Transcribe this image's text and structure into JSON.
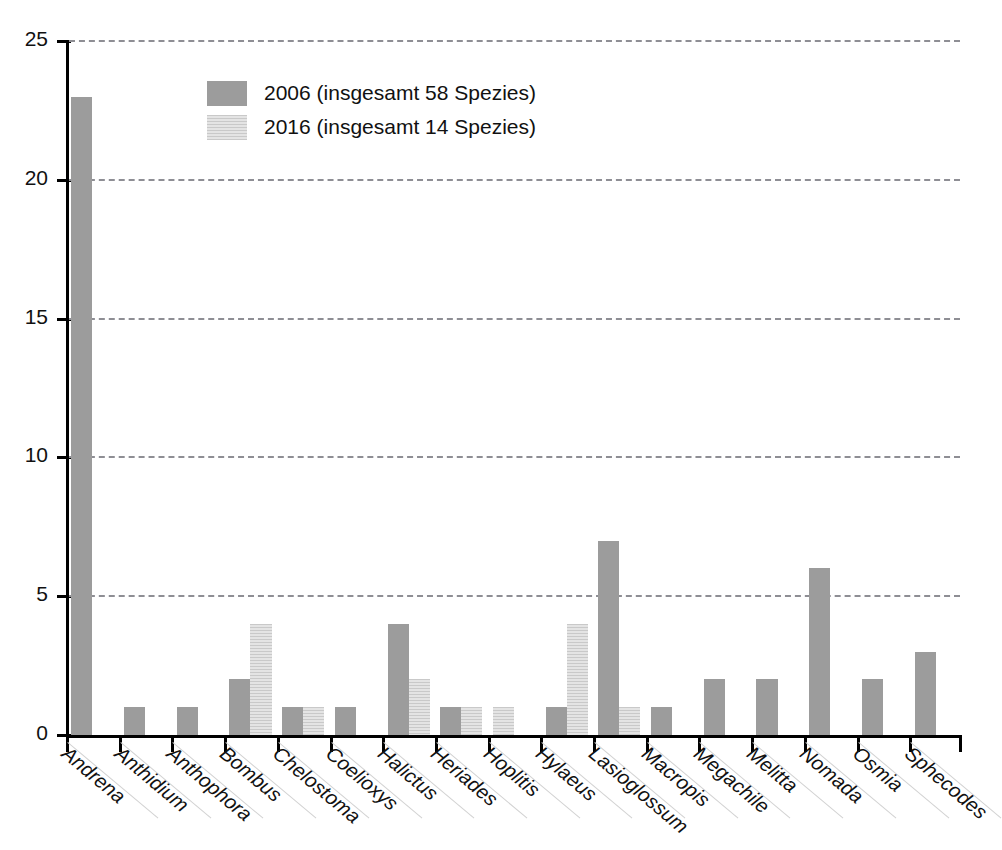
{
  "crop_fragment": "..",
  "legend": {
    "position": "inside-top-left",
    "entries": [
      {
        "label": "2006 (insgesamt 58 Spezies)",
        "color": "#9c9c9c",
        "pattern": "solid"
      },
      {
        "label": "2016 (insgesamt 14 Spezies)",
        "color": "#dcdcdc",
        "pattern": "horizontal-lines"
      }
    ]
  },
  "chart_data": {
    "type": "bar",
    "title": "",
    "subtitle": "",
    "xlabel": "",
    "ylabel": "",
    "ylim": [
      0,
      25
    ],
    "yticks": [
      0,
      5,
      10,
      15,
      20,
      25
    ],
    "ytick_labels": [
      "0",
      "5",
      "10",
      "15",
      "20",
      "25"
    ],
    "grid": "horizontal-dashed",
    "legend_position": "inside-top-left",
    "categories": [
      "Andrena",
      "Anthidium",
      "Anthophora",
      "Bombus",
      "Chelostoma",
      "Coelioxys",
      "Halictus",
      "Heriades",
      "Hoplitis",
      "Hylaeus",
      "Lasioglossum",
      "Macropis",
      "Megachile",
      "Melitta",
      "Nomada",
      "Osmia",
      "Sphecodes"
    ],
    "series": [
      {
        "name": "2006 (insgesamt 58 Spezies)",
        "color": "#9c9c9c",
        "total": 58,
        "values": [
          23,
          1,
          1,
          2,
          1,
          1,
          4,
          1,
          0,
          1,
          7,
          1,
          2,
          2,
          6,
          2,
          3
        ]
      },
      {
        "name": "2016 (insgesamt 14 Spezies)",
        "color": "#dcdcdc",
        "total": 14,
        "values": [
          0,
          0,
          0,
          4,
          1,
          0,
          2,
          1,
          1,
          4,
          1,
          0,
          0,
          0,
          0,
          0,
          0
        ]
      }
    ]
  }
}
